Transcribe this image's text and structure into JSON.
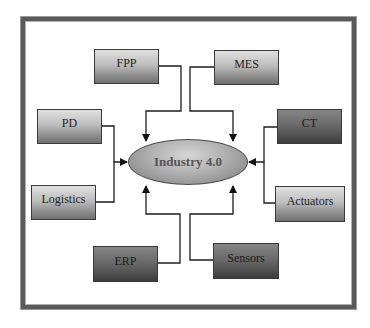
{
  "diagram": {
    "center": {
      "label": "Industry 4.0"
    },
    "nodes": [
      {
        "id": "fpp",
        "label": "FPP",
        "shade": "light",
        "position": "top-left"
      },
      {
        "id": "mes",
        "label": "MES",
        "shade": "light",
        "position": "top-right"
      },
      {
        "id": "pd",
        "label": "PD",
        "shade": "light",
        "position": "left-upper"
      },
      {
        "id": "ct",
        "label": "CT",
        "shade": "dark",
        "position": "right-upper"
      },
      {
        "id": "logistics",
        "label": "Logistics",
        "shade": "light",
        "position": "left-lower"
      },
      {
        "id": "actuators",
        "label": "Actuators",
        "shade": "light",
        "position": "right-lower"
      },
      {
        "id": "erp",
        "label": "ERP",
        "shade": "dark",
        "position": "bottom-left"
      },
      {
        "id": "sensors",
        "label": "Sensors",
        "shade": "dark",
        "position": "bottom-right"
      }
    ],
    "edges": [
      {
        "from": "FPP",
        "to": "Industry 4.0"
      },
      {
        "from": "MES",
        "to": "Industry 4.0"
      },
      {
        "from": "PD",
        "to": "Industry 4.0"
      },
      {
        "from": "Logistics",
        "to": "Industry 4.0"
      },
      {
        "from": "CT",
        "to": "Industry 4.0"
      },
      {
        "from": "Actuators",
        "to": "Industry 4.0"
      },
      {
        "from": "ERP",
        "to": "Industry 4.0"
      },
      {
        "from": "Sensors",
        "to": "Industry 4.0"
      }
    ],
    "colors": {
      "light_box_top": "#e0e0e0",
      "light_box_bottom": "#707070",
      "dark_box_top": "#858585",
      "dark_box_bottom": "#3c3c3c",
      "hub_fill": "#b0b0b0",
      "hub_text": "#555555",
      "line": "#1e1e1e",
      "frame": "#5a5a5a"
    }
  }
}
